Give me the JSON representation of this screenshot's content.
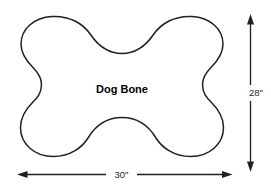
{
  "diagram": {
    "background_color": "#ffffff",
    "stroke_color": "#231f20",
    "shape": {
      "name": "Dog Bone",
      "label": "Dog Bone",
      "label_color": "#000000",
      "fill_color": "#ffffff"
    },
    "dimensions": {
      "width": {
        "label": "30\"",
        "value": 30,
        "unit": "inches",
        "orientation": "horizontal",
        "position": "bottom"
      },
      "height": {
        "label": "28\"",
        "value": 28,
        "unit": "inches",
        "orientation": "vertical",
        "position": "right"
      }
    }
  }
}
